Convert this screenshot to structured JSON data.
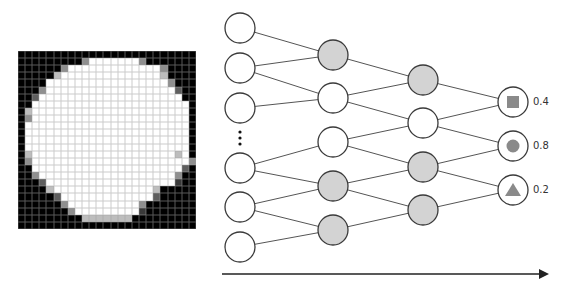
{
  "figure": {
    "left_panel": {
      "description": "25x25 pixelated image of a white circle on a black background",
      "grid_size": 25,
      "palette": {
        "0": "#000000",
        "1": "#ffffff",
        "a": "#bdbdbd",
        "b": "#8f8f8f",
        "c": "#5e5e5e",
        "d": "#3a3a3a"
      },
      "rows": [
        "0000000000000000000000000",
        "000000000b1111111b0000000",
        "000000b1111111111111b0000",
        "00000a11111111111111a0000",
        "000011111111111111111b000",
        "000b111111111111111111c00",
        "00c1111111111111111111100",
        "0011111111111111111111110",
        "0a11111111111111111111110",
        "0b11111111111111111111110",
        "0111111111111111111111110",
        "0111111111111111111111110",
        "0111111111111111111111110",
        "0111111111111111111111110",
        "0a11111111111111111111a10",
        "0b1111111111111111111111b",
        "00111111111111111111111c0",
        "00b1111111111111111111b00",
        "000c111111111111111111d00",
        "0000a11111111111111a00000",
        "00000c1111111111111c00000",
        "000000b1111111111b0000000",
        "0000000b111111111d0000000",
        "000000000aaaaaaa000000000",
        "0000000000000000000000000"
      ]
    },
    "network": {
      "node_radius": 15,
      "node_stroke": "#3a3a3a",
      "edge_color": "#555555",
      "gray_fill": "#d3d3d3",
      "white_fill": "#ffffff",
      "layers": [
        {
          "name": "input",
          "x": 240,
          "nodes": [
            {
              "y": 28,
              "fill": "white"
            },
            {
              "y": 68,
              "fill": "white"
            },
            {
              "y": 108,
              "fill": "white"
            },
            {
              "y": 168,
              "fill": "white"
            },
            {
              "y": 207,
              "fill": "white"
            },
            {
              "y": 247,
              "fill": "white"
            }
          ]
        },
        {
          "name": "hidden1",
          "x": 333,
          "nodes": [
            {
              "y": 55,
              "fill": "gray"
            },
            {
              "y": 98,
              "fill": "white"
            },
            {
              "y": 142,
              "fill": "white"
            },
            {
              "y": 186,
              "fill": "gray"
            },
            {
              "y": 230,
              "fill": "gray"
            }
          ]
        },
        {
          "name": "hidden2",
          "x": 423,
          "nodes": [
            {
              "y": 80,
              "fill": "gray"
            },
            {
              "y": 123,
              "fill": "white"
            },
            {
              "y": 167,
              "fill": "gray"
            },
            {
              "y": 210,
              "fill": "gray"
            }
          ]
        },
        {
          "name": "output",
          "x": 513,
          "nodes": [
            {
              "y": 102,
              "fill": "white",
              "glyph": "square",
              "label": "0.4"
            },
            {
              "y": 146,
              "fill": "white",
              "glyph": "circle",
              "label": "0.8"
            },
            {
              "y": 190,
              "fill": "white",
              "glyph": "triangle",
              "label": "0.2"
            }
          ]
        }
      ],
      "edges": [
        [
          [
            0,
            0
          ],
          [
            1,
            0
          ]
        ],
        [
          [
            0,
            1
          ],
          [
            1,
            0
          ]
        ],
        [
          [
            0,
            1
          ],
          [
            1,
            1
          ]
        ],
        [
          [
            0,
            2
          ],
          [
            1,
            1
          ]
        ],
        [
          [
            0,
            3
          ],
          [
            1,
            2
          ]
        ],
        [
          [
            0,
            3
          ],
          [
            1,
            3
          ]
        ],
        [
          [
            0,
            4
          ],
          [
            1,
            3
          ]
        ],
        [
          [
            0,
            4
          ],
          [
            1,
            4
          ]
        ],
        [
          [
            0,
            5
          ],
          [
            1,
            4
          ]
        ],
        [
          [
            1,
            0
          ],
          [
            2,
            0
          ]
        ],
        [
          [
            1,
            1
          ],
          [
            2,
            0
          ]
        ],
        [
          [
            1,
            1
          ],
          [
            2,
            1
          ]
        ],
        [
          [
            1,
            2
          ],
          [
            2,
            1
          ]
        ],
        [
          [
            1,
            2
          ],
          [
            2,
            2
          ]
        ],
        [
          [
            1,
            3
          ],
          [
            2,
            2
          ]
        ],
        [
          [
            1,
            3
          ],
          [
            2,
            3
          ]
        ],
        [
          [
            1,
            4
          ],
          [
            2,
            3
          ]
        ],
        [
          [
            2,
            0
          ],
          [
            3,
            0
          ]
        ],
        [
          [
            2,
            1
          ],
          [
            3,
            0
          ]
        ],
        [
          [
            2,
            1
          ],
          [
            3,
            1
          ]
        ],
        [
          [
            2,
            2
          ],
          [
            3,
            1
          ]
        ],
        [
          [
            2,
            2
          ],
          [
            3,
            2
          ]
        ],
        [
          [
            2,
            3
          ],
          [
            3,
            2
          ]
        ]
      ],
      "ellipsis": {
        "x": 240,
        "dots_y": [
          132,
          138,
          144
        ],
        "glyph": "vertical-ellipsis"
      },
      "glyph_color": "#8a8a8a",
      "output_labels": [
        "0.4",
        "0.8",
        "0.2"
      ]
    },
    "arrow": {
      "x1": 222,
      "x2": 549,
      "y": 274,
      "color": "#222222",
      "direction": "right"
    }
  }
}
